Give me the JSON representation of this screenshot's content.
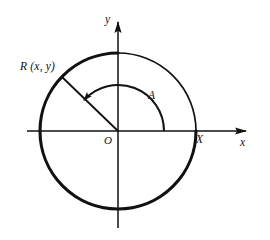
{
  "figure": {
    "background_color": "#ffffff",
    "ink_color": "#111111",
    "labels": {
      "point_R": "R (x, y)",
      "angle_A": "A",
      "origin_O": "O",
      "point_X": "X",
      "axis_x": "x",
      "axis_y": "y"
    },
    "geometry": {
      "center_x": 118,
      "center_y": 131,
      "radius": 78,
      "angle_degrees": 136,
      "arc_radius": 46,
      "x_axis_start": 27,
      "x_axis_end": 253,
      "y_axis_top": 14,
      "y_axis_bottom": 228
    }
  }
}
